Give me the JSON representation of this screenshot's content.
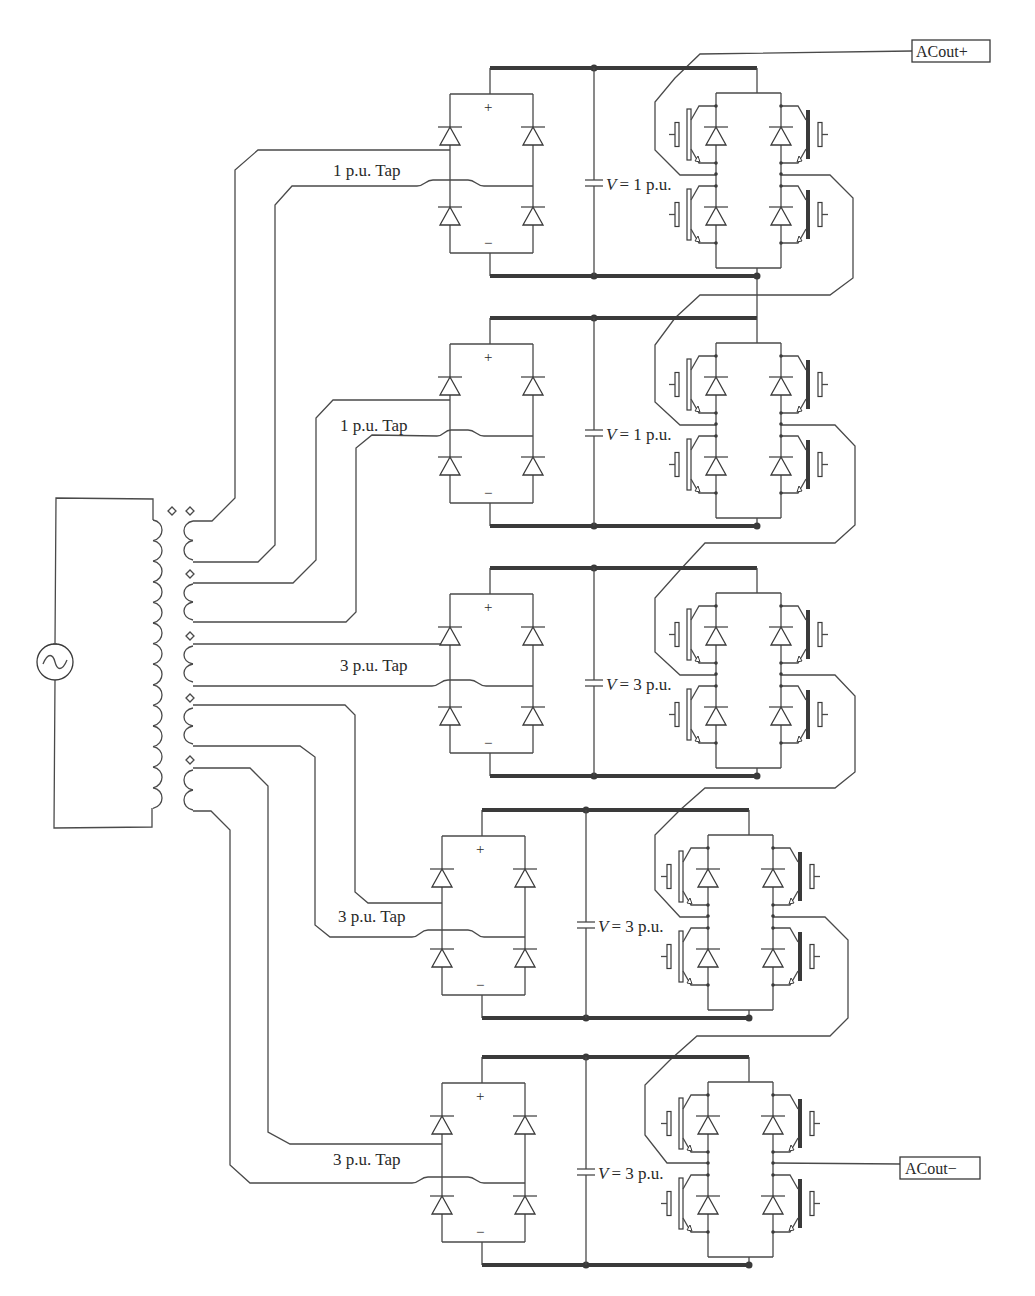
{
  "diagram": {
    "source": {
      "symbol": "ac-source",
      "label": "~"
    },
    "transformer": {
      "primary_turns": 14,
      "secondary_windings": 5
    },
    "terminals": {
      "top": "ACout+",
      "bottom": "ACout−"
    },
    "cells": [
      {
        "tap_label": "1 p.u. Tap",
        "v_prefix": "V",
        "v_value": "= 1 p.u.",
        "plus": "+",
        "minus": "−"
      },
      {
        "tap_label": "1 p.u. Tap",
        "v_prefix": "V",
        "v_value": "= 1 p.u.",
        "plus": "+",
        "minus": "−"
      },
      {
        "tap_label": "3 p.u. Tap",
        "v_prefix": "V",
        "v_value": "= 3 p.u.",
        "plus": "+",
        "minus": "−"
      },
      {
        "tap_label": "3 p.u. Tap",
        "v_prefix": "V",
        "v_value": "= 3 p.u.",
        "plus": "+",
        "minus": "−"
      },
      {
        "tap_label": "3 p.u. Tap",
        "v_prefix": "V",
        "v_value": "= 3 p.u.",
        "plus": "+",
        "minus": "−"
      }
    ]
  }
}
